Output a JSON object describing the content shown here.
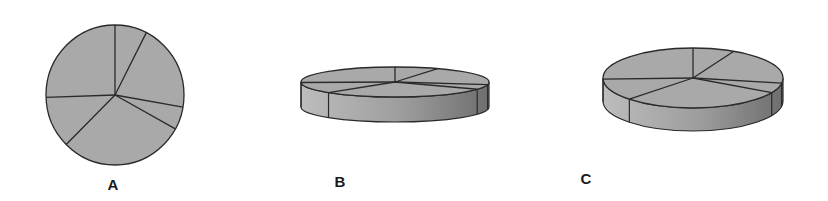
{
  "figure": {
    "colors": {
      "top_fill": "#a9a9a9",
      "side_light": "#bdbdbd",
      "side_dark": "#6e6e6e",
      "stroke": "#2a2a2a"
    },
    "slice_angles_deg": [
      27,
      73,
      19,
      106,
      43,
      92
    ],
    "panels": [
      {
        "id": "A",
        "label": "A",
        "style": "flat",
        "cx": 115,
        "cy": 95,
        "rx": 69,
        "ry": 70,
        "depth": 0,
        "label_x": 113,
        "label_y": 176
      },
      {
        "id": "B",
        "label": "B",
        "style": "3d",
        "cx": 395,
        "cy": 82,
        "rx": 94,
        "ry": 15,
        "depth": 25,
        "label_x": 340,
        "label_y": 173
      },
      {
        "id": "C",
        "label": "C",
        "style": "3d",
        "cx": 693,
        "cy": 78,
        "rx": 90,
        "ry": 30,
        "depth": 23,
        "label_x": 586,
        "label_y": 170
      }
    ]
  },
  "chart_data": {
    "type": "pie",
    "title": "",
    "categories": [
      "slice 1",
      "slice 2",
      "slice 3",
      "slice 4",
      "slice 5",
      "slice 6"
    ],
    "values": [
      7.5,
      20.3,
      5.3,
      29.4,
      11.9,
      25.6
    ],
    "start_angle": "12 o'clock, clockwise",
    "variants": [
      {
        "label": "A",
        "view": "flat 2D"
      },
      {
        "label": "B",
        "view": "3D, strong tilt"
      },
      {
        "label": "C",
        "view": "3D, moderate tilt"
      }
    ],
    "legend": "none",
    "data_labels": "none"
  }
}
